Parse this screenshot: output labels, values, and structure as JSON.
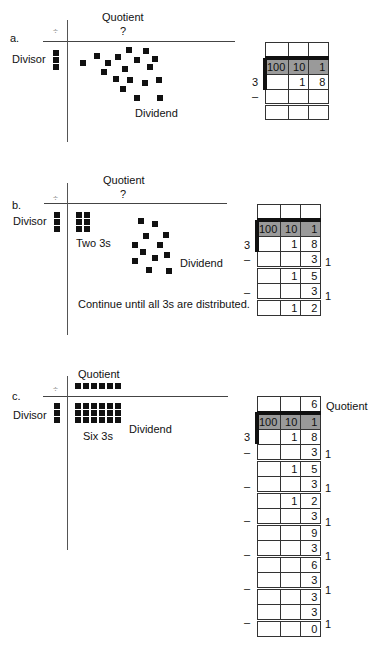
{
  "panels": {
    "a": {
      "label": "a.",
      "divide_symbol": "÷",
      "quotient_label": "Quotient",
      "quotient_value": "?",
      "divisor_label": "Divisor",
      "dividend_label": "Dividend",
      "divisor_squares": 3,
      "dividend_squares": 18,
      "table": {
        "divisor": "3",
        "minus": "–",
        "quotient_row": [
          "",
          "",
          ""
        ],
        "place_headers": [
          "100",
          "10",
          "1"
        ],
        "rows": [
          [
            "",
            "1",
            "8"
          ],
          [
            "",
            "",
            ""
          ],
          [
            "",
            "",
            ""
          ]
        ]
      }
    },
    "b": {
      "label": "b.",
      "divide_symbol": "÷",
      "quotient_label": "Quotient",
      "quotient_value": "?",
      "divisor_label": "Divisor",
      "group_label": "Two 3s",
      "dividend_label": "Dividend",
      "note": "Continue until all 3s are distributed.",
      "divisor_squares": 3,
      "group_squares": 6,
      "dividend_squares": 12,
      "table": {
        "divisor": "3",
        "minus": "–",
        "quotient_row": [
          "",
          "",
          ""
        ],
        "place_headers": [
          "100",
          "10",
          "1"
        ],
        "rows": [
          {
            "cells": [
              "",
              "1",
              "8"
            ],
            "side": ""
          },
          {
            "cells": [
              "",
              "",
              "3"
            ],
            "side": "1",
            "minus": true
          },
          {
            "cells": [
              "",
              "1",
              "5"
            ],
            "side": ""
          },
          {
            "cells": [
              "",
              "",
              "3"
            ],
            "side": "1",
            "minus": true
          },
          {
            "cells": [
              "",
              "1",
              "2"
            ],
            "side": ""
          }
        ]
      }
    },
    "c": {
      "label": "c.",
      "divide_symbol": "÷",
      "quotient_label": "Quotient",
      "divisor_label": "Divisor",
      "group_label": "Six 3s",
      "dividend_label": "Dividend",
      "quotient_squares": 6,
      "divisor_squares": 3,
      "group_squares": 18,
      "table": {
        "divisor": "3",
        "quotient_row": [
          "",
          "",
          "6"
        ],
        "quotient_side_label": "Quotient",
        "place_headers": [
          "100",
          "10",
          "1"
        ],
        "rows": [
          {
            "cells": [
              "",
              "1",
              "8"
            ],
            "side": ""
          },
          {
            "cells": [
              "",
              "",
              "3"
            ],
            "side": "1",
            "minus": true
          },
          {
            "cells": [
              "",
              "1",
              "5"
            ],
            "side": ""
          },
          {
            "cells": [
              "",
              "",
              "3"
            ],
            "side": "1",
            "minus": true
          },
          {
            "cells": [
              "",
              "1",
              "2"
            ],
            "side": ""
          },
          {
            "cells": [
              "",
              "",
              "3"
            ],
            "side": "1",
            "minus": true
          },
          {
            "cells": [
              "",
              "",
              "9"
            ],
            "side": ""
          },
          {
            "cells": [
              "",
              "",
              "3"
            ],
            "side": "1",
            "minus": true
          },
          {
            "cells": [
              "",
              "",
              "6"
            ],
            "side": ""
          },
          {
            "cells": [
              "",
              "",
              "3"
            ],
            "side": "1",
            "minus": true
          },
          {
            "cells": [
              "",
              "",
              "3"
            ],
            "side": ""
          },
          {
            "cells": [
              "",
              "",
              "3"
            ],
            "side": "1",
            "minus": true
          },
          {
            "cells": [
              "",
              "",
              "0"
            ],
            "side": ""
          }
        ]
      }
    }
  },
  "colors": {
    "header_shade": "#9a9a9a",
    "ink": "#111111"
  }
}
